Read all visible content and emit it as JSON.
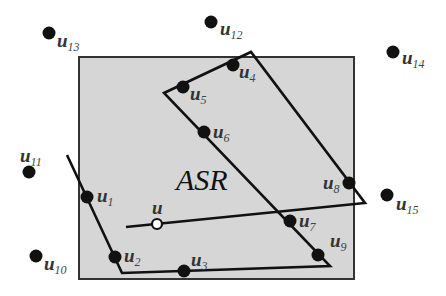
{
  "diagram": {
    "region_label": "ASR",
    "colors": {
      "background": "#ffffff",
      "region_fill": "#d6d6d6",
      "region_stroke": "#333333",
      "line": "#111111",
      "node_fill": "#111111",
      "query_node_fill": "#ffffff"
    },
    "region_rect": {
      "x": 79,
      "y": 57,
      "width": 275,
      "height": 222
    },
    "polygon_outline": [
      [
        67,
        155
      ],
      [
        122,
        273
      ],
      [
        330,
        266
      ],
      [
        164,
        93
      ],
      [
        251,
        52
      ],
      [
        365,
        203
      ],
      [
        126,
        227
      ]
    ],
    "query_node": {
      "id": "u",
      "label": "u",
      "sub": "",
      "x": 157,
      "y": 224,
      "lx": 152,
      "ly": 214
    },
    "nodes": [
      {
        "id": "u1",
        "label": "u",
        "sub": "1",
        "x": 87,
        "y": 197,
        "lx": 97,
        "ly": 202
      },
      {
        "id": "u2",
        "label": "u",
        "sub": "2",
        "x": 115,
        "y": 257,
        "lx": 124,
        "ly": 262
      },
      {
        "id": "u3",
        "label": "u",
        "sub": "3",
        "x": 184,
        "y": 271,
        "lx": 191,
        "ly": 266
      },
      {
        "id": "u4",
        "label": "u",
        "sub": "4",
        "x": 233,
        "y": 65,
        "lx": 239,
        "ly": 78
      },
      {
        "id": "u5",
        "label": "u",
        "sub": "5",
        "x": 183,
        "y": 87,
        "lx": 190,
        "ly": 100
      },
      {
        "id": "u6",
        "label": "u",
        "sub": "6",
        "x": 204,
        "y": 132,
        "lx": 213,
        "ly": 138
      },
      {
        "id": "u7",
        "label": "u",
        "sub": "7",
        "x": 290,
        "y": 221,
        "lx": 299,
        "ly": 227
      },
      {
        "id": "u8",
        "label": "u",
        "sub": "8",
        "x": 349,
        "y": 183,
        "lx": 323,
        "ly": 189
      },
      {
        "id": "u9",
        "label": "u",
        "sub": "9",
        "x": 318,
        "y": 255,
        "lx": 330,
        "ly": 247
      },
      {
        "id": "u10",
        "label": "u",
        "sub": "10",
        "x": 36,
        "y": 256,
        "lx": 44,
        "ly": 270
      },
      {
        "id": "u11",
        "label": "u",
        "sub": "11",
        "x": 29,
        "y": 172,
        "lx": 20,
        "ly": 162
      },
      {
        "id": "u12",
        "label": "u",
        "sub": "12",
        "x": 211,
        "y": 22,
        "lx": 220,
        "ly": 35
      },
      {
        "id": "u13",
        "label": "u",
        "sub": "13",
        "x": 49,
        "y": 33,
        "lx": 57,
        "ly": 47
      },
      {
        "id": "u14",
        "label": "u",
        "sub": "14",
        "x": 393,
        "y": 52,
        "lx": 402,
        "ly": 64
      },
      {
        "id": "u15",
        "label": "u",
        "sub": "15",
        "x": 387,
        "y": 195,
        "lx": 396,
        "ly": 210
      }
    ]
  }
}
